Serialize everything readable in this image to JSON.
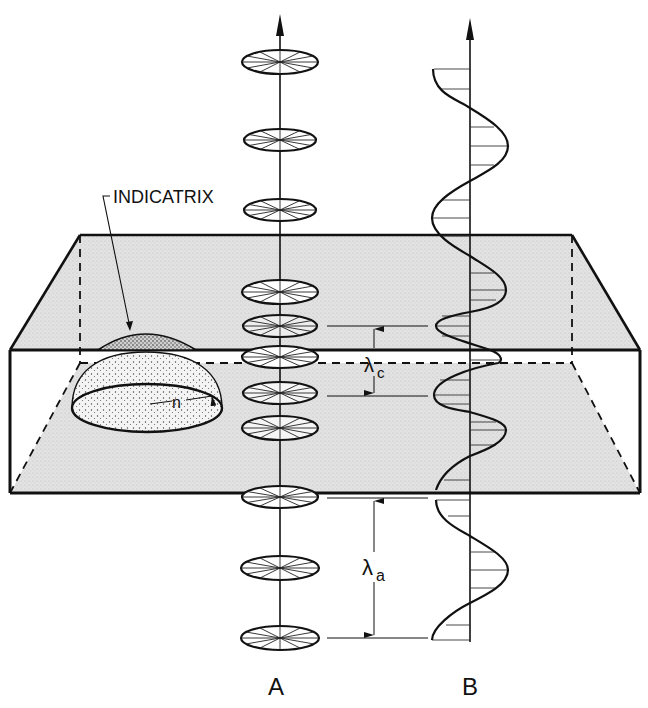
{
  "figure": {
    "labels": {
      "indicatrix": "INDICATRIX",
      "n": "n",
      "lambda_c_symbol": "λ",
      "lambda_c_sub": "c",
      "lambda_a_symbol": "λ",
      "lambda_a_sub": "a",
      "column_a": "A",
      "column_b": "B"
    },
    "colors": {
      "ink": "#111111",
      "slab_fill": "#dcdcdc",
      "background": "#ffffff"
    },
    "slab": {
      "top_back_y": 235,
      "front_top_y": 350,
      "back_bottom_y": 363,
      "front_bottom_y": 493
    },
    "column_a": {
      "axis_x": 280,
      "arrow_tip_y": 15,
      "disc_centers_y": [
        62,
        140,
        210,
        292,
        328,
        356,
        386,
        425,
        495,
        566,
        636
      ]
    },
    "column_b": {
      "axis_x": 470,
      "arrow_tip_y": 20
    },
    "wavelengths": {
      "lambda_c": {
        "from_y": 328,
        "to_y": 396
      },
      "lambda_a": {
        "from_y": 497,
        "to_y": 637
      }
    }
  }
}
